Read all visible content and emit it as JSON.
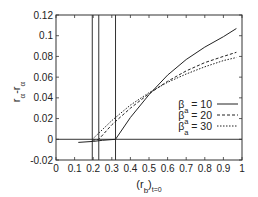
{
  "chart_data": {
    "type": "line",
    "title": "",
    "xlabel": "(r_b)_t=0",
    "ylabel": "r_a - r_a",
    "xlim": [
      0,
      1
    ],
    "ylim": [
      -0.02,
      0.12
    ],
    "grid": false,
    "legend_position": "inside lower right",
    "xticks": [
      "0",
      "0.1",
      "0.2",
      "0.3",
      "0.4",
      "0.5",
      "0.6",
      "0.7",
      "0.8",
      "0.9",
      "1"
    ],
    "yticks": [
      "-0.02",
      "0",
      "0.02",
      "0.04",
      "0.06",
      "0.08",
      "0.1",
      "0.12"
    ],
    "vertical_lines": [
      0.195,
      0.23,
      0.32
    ],
    "series": [
      {
        "name": "β_a = 10",
        "style": "solid",
        "x": [
          0.12,
          0.2,
          0.25,
          0.32,
          0.4,
          0.5,
          0.6,
          0.7,
          0.8,
          0.9,
          0.97
        ],
        "y": [
          -0.003,
          -0.002,
          -0.001,
          0.0,
          0.021,
          0.043,
          0.062,
          0.077,
          0.089,
          0.099,
          0.107
        ]
      },
      {
        "name": "β_a = 20",
        "style": "dashed",
        "x": [
          0.195,
          0.23,
          0.3,
          0.4,
          0.5,
          0.6,
          0.7,
          0.8,
          0.9,
          0.97
        ],
        "y": [
          -0.001,
          0.0,
          0.014,
          0.03,
          0.044,
          0.056,
          0.066,
          0.074,
          0.08,
          0.084
        ]
      },
      {
        "name": "β_a = 30",
        "style": "dotted",
        "x": [
          0.195,
          0.3,
          0.4,
          0.5,
          0.6,
          0.7,
          0.8,
          0.9,
          0.97
        ],
        "y": [
          0.0,
          0.018,
          0.033,
          0.045,
          0.055,
          0.063,
          0.07,
          0.076,
          0.079
        ]
      }
    ]
  },
  "labels": {
    "y_axis_main": "r",
    "y_axis_sub1": "α",
    "y_axis_dash": "-",
    "y_axis_main2": "r",
    "y_axis_sub2": "α",
    "x_axis_main": "(r",
    "x_axis_sub1": "b",
    "x_axis_close": ")",
    "x_axis_sub2": "t=0",
    "legend": [
      {
        "prefix": "β",
        "sub": "a",
        "suffix": " = 10"
      },
      {
        "prefix": "β",
        "sub": "a",
        "suffix": " = 20"
      },
      {
        "prefix": "β",
        "sub": "a",
        "suffix": " = 30"
      }
    ]
  }
}
